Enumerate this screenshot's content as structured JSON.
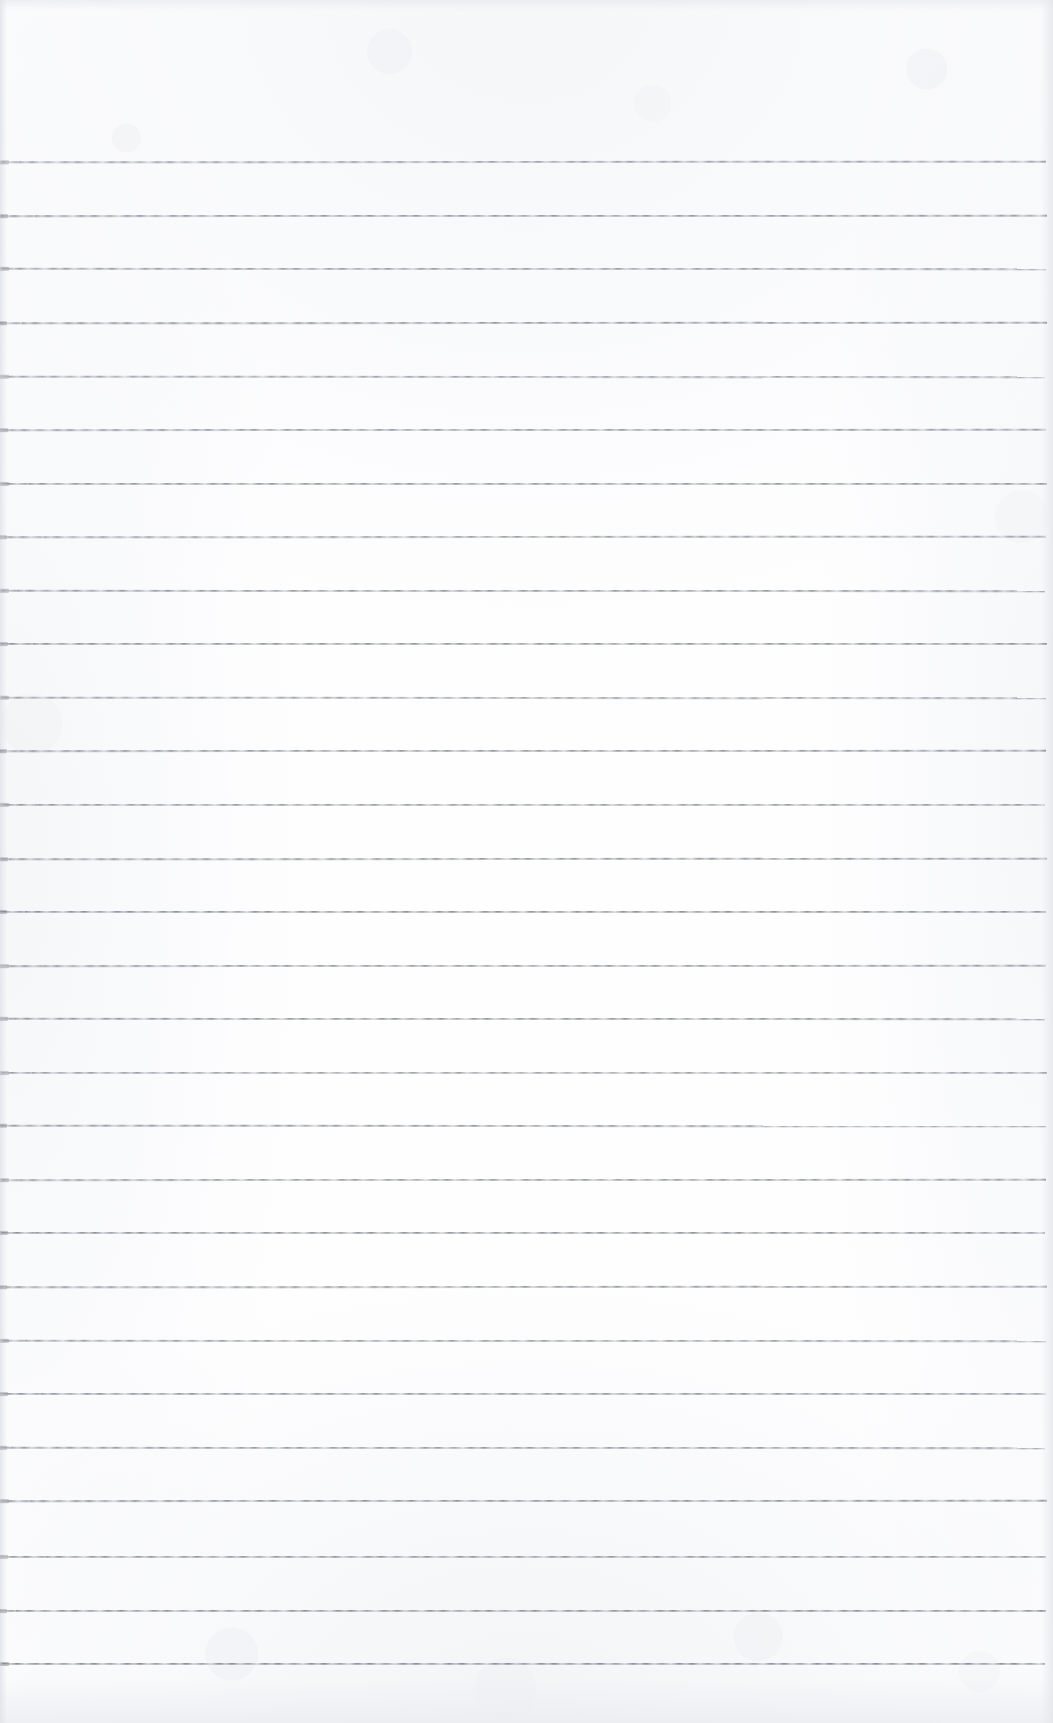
{
  "document": {
    "kind": "scanned-ruled-notebook-page",
    "title": "Blank lined notebook page",
    "visible_text": "",
    "page_background_color": "#fefeff",
    "rule_color": "#767a82",
    "page_width_px": 1053,
    "page_height_px": 1723
  },
  "ruling": {
    "line_count": 29,
    "first_line_y_px": 161,
    "line_spacing_px": 53.6,
    "line_thickness_px": 2,
    "line_left_x_px": 2,
    "line_right_x_px": 1046,
    "top_margin_px": 161,
    "bottom_margin_px": 60,
    "lines": [
      {
        "index": 1,
        "y": 161,
        "left": 2,
        "right": 1046,
        "opacity": 0.74,
        "tilt": -0.04
      },
      {
        "index": 2,
        "y": 215,
        "left": 1,
        "right": 1047,
        "opacity": 0.8,
        "tilt": -0.02
      },
      {
        "index": 3,
        "y": 268,
        "left": 2,
        "right": 1046,
        "opacity": 0.76,
        "tilt": 0.02
      },
      {
        "index": 4,
        "y": 322,
        "left": 0,
        "right": 1047,
        "opacity": 0.82,
        "tilt": -0.03
      },
      {
        "index": 5,
        "y": 376,
        "left": 2,
        "right": 1045,
        "opacity": 0.72,
        "tilt": 0.03
      },
      {
        "index": 6,
        "y": 429,
        "left": 1,
        "right": 1046,
        "opacity": 0.78,
        "tilt": -0.02
      },
      {
        "index": 7,
        "y": 483,
        "left": 2,
        "right": 1047,
        "opacity": 0.8,
        "tilt": 0.01
      },
      {
        "index": 8,
        "y": 536,
        "left": 0,
        "right": 1046,
        "opacity": 0.75,
        "tilt": -0.03
      },
      {
        "index": 9,
        "y": 590,
        "left": 2,
        "right": 1045,
        "opacity": 0.79,
        "tilt": 0.02
      },
      {
        "index": 10,
        "y": 643,
        "left": 1,
        "right": 1047,
        "opacity": 0.83,
        "tilt": -0.01
      },
      {
        "index": 11,
        "y": 697,
        "left": 2,
        "right": 1046,
        "opacity": 0.74,
        "tilt": 0.03
      },
      {
        "index": 12,
        "y": 750,
        "left": 0,
        "right": 1046,
        "opacity": 0.8,
        "tilt": -0.02
      },
      {
        "index": 13,
        "y": 804,
        "left": 2,
        "right": 1045,
        "opacity": 0.77,
        "tilt": 0.01
      },
      {
        "index": 14,
        "y": 858,
        "left": 1,
        "right": 1047,
        "opacity": 0.81,
        "tilt": -0.03
      },
      {
        "index": 15,
        "y": 911,
        "left": 0,
        "right": 1046,
        "opacity": 0.86,
        "tilt": 0.01
      },
      {
        "index": 16,
        "y": 965,
        "left": 2,
        "right": 1046,
        "opacity": 0.78,
        "tilt": -0.02
      },
      {
        "index": 17,
        "y": 1018,
        "left": 1,
        "right": 1045,
        "opacity": 0.82,
        "tilt": 0.02
      },
      {
        "index": 18,
        "y": 1072,
        "left": 2,
        "right": 1047,
        "opacity": 0.73,
        "tilt": -0.01
      },
      {
        "index": 19,
        "y": 1125,
        "left": 0,
        "right": 1046,
        "opacity": 0.8,
        "tilt": 0.03
      },
      {
        "index": 20,
        "y": 1179,
        "left": 2,
        "right": 1046,
        "opacity": 0.76,
        "tilt": -0.02
      },
      {
        "index": 21,
        "y": 1232,
        "left": 1,
        "right": 1045,
        "opacity": 0.84,
        "tilt": 0.01
      },
      {
        "index": 22,
        "y": 1286,
        "left": 0,
        "right": 1047,
        "opacity": 0.79,
        "tilt": -0.03
      },
      {
        "index": 23,
        "y": 1340,
        "left": 2,
        "right": 1046,
        "opacity": 0.75,
        "tilt": 0.02
      },
      {
        "index": 24,
        "y": 1393,
        "left": 1,
        "right": 1046,
        "opacity": 0.81,
        "tilt": -0.01
      },
      {
        "index": 25,
        "y": 1447,
        "left": 0,
        "right": 1045,
        "opacity": 0.78,
        "tilt": 0.02
      },
      {
        "index": 26,
        "y": 1500,
        "left": 2,
        "right": 1047,
        "opacity": 0.83,
        "tilt": -0.02
      },
      {
        "index": 27,
        "y": 1556,
        "left": 1,
        "right": 1046,
        "opacity": 0.8,
        "tilt": 0.01
      },
      {
        "index": 28,
        "y": 1610,
        "left": 0,
        "right": 1046,
        "opacity": 0.84,
        "tilt": -0.01
      },
      {
        "index": 29,
        "y": 1663,
        "left": 2,
        "right": 1045,
        "opacity": 0.88,
        "tilt": 0.0
      }
    ]
  }
}
